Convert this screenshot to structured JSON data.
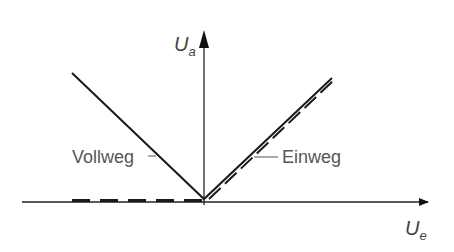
{
  "diagram": {
    "type": "transfer-characteristic",
    "y_axis": {
      "label": "U",
      "subscript": "a"
    },
    "x_axis": {
      "label": "U",
      "subscript": "e"
    },
    "curves": [
      {
        "name": "Vollweg",
        "style": "solid",
        "shape": "V (full-wave, |Ue|)"
      },
      {
        "name": "Einweg",
        "style": "dashed",
        "shape": "zero for Ue<0, linear for Ue>0"
      }
    ],
    "labels": {
      "vollweg": "Vollweg",
      "einweg": "Einweg"
    }
  }
}
